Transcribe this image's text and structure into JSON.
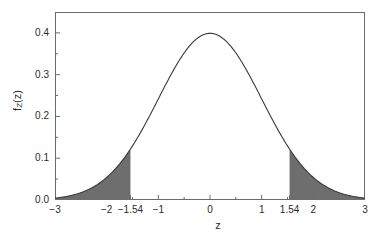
{
  "chart_data": {
    "type": "area",
    "title": "",
    "subtitle": "",
    "xlabel": "z",
    "ylabel": "f_Z(z)",
    "ylabel_base": "f",
    "ylabel_sub": "Z",
    "ylabel_arg": "(z)",
    "xlim": [
      -3,
      3
    ],
    "ylim": [
      0.0,
      0.45
    ],
    "grid": false,
    "legend": null,
    "x_ticks": [
      {
        "value": -3,
        "label": "−3"
      },
      {
        "value": -2,
        "label": "−2"
      },
      {
        "value": -1.54,
        "label": "−1.54"
      },
      {
        "value": -1,
        "label": "−1"
      },
      {
        "value": 0,
        "label": "0"
      },
      {
        "value": 1,
        "label": "1"
      },
      {
        "value": 1.54,
        "label": "1.54"
      },
      {
        "value": 2,
        "label": "2"
      },
      {
        "value": 3,
        "label": "3"
      }
    ],
    "x_minor_ticks": [
      -2.5,
      -1.5,
      -0.5,
      0.5,
      1.5,
      2.5
    ],
    "y_ticks": [
      {
        "value": 0.0,
        "label": "0.0"
      },
      {
        "value": 0.1,
        "label": "0.1"
      },
      {
        "value": 0.2,
        "label": "0.2"
      },
      {
        "value": 0.3,
        "label": "0.3"
      },
      {
        "value": 0.4,
        "label": "0.4"
      }
    ],
    "y_minor_ticks": [
      0.05,
      0.15,
      0.25,
      0.35,
      0.45
    ],
    "series": [
      {
        "name": "Standard normal density",
        "type": "line",
        "formula": "phi(z) = exp(-z^2/2)/sqrt(2*pi)",
        "color": "#3a3a3a",
        "line_width": 1,
        "x": [
          -3.0,
          -2.8,
          -2.6,
          -2.4,
          -2.2,
          -2.0,
          -1.8,
          -1.6,
          -1.54,
          -1.4,
          -1.2,
          -1.0,
          -0.8,
          -0.6,
          -0.4,
          -0.2,
          0.0,
          0.2,
          0.4,
          0.6,
          0.8,
          1.0,
          1.2,
          1.4,
          1.54,
          1.6,
          1.8,
          2.0,
          2.2,
          2.4,
          2.6,
          2.8,
          3.0
        ],
        "y": [
          0.0044,
          0.0079,
          0.0136,
          0.0224,
          0.0355,
          0.054,
          0.079,
          0.1109,
          0.1219,
          0.1497,
          0.1942,
          0.242,
          0.2897,
          0.3332,
          0.3683,
          0.391,
          0.3989,
          0.391,
          0.3683,
          0.3332,
          0.2897,
          0.242,
          0.1942,
          0.1497,
          0.1219,
          0.1109,
          0.079,
          0.054,
          0.0355,
          0.0224,
          0.0136,
          0.0079,
          0.0044
        ]
      }
    ],
    "shaded_regions": [
      {
        "name": "left-tail",
        "from": -3.0,
        "to": -1.54,
        "color": "#6e6e6e",
        "label": "lower rejection region"
      },
      {
        "name": "right-tail",
        "from": 1.54,
        "to": 3.0,
        "color": "#6e6e6e",
        "label": "upper rejection region"
      }
    ],
    "annotations": [],
    "colors": {
      "curve": "#3a3a3a",
      "shade": "#6e6e6e",
      "axis": "#6b6b6b",
      "text": "#2b2b2b",
      "background": "#ffffff"
    }
  }
}
